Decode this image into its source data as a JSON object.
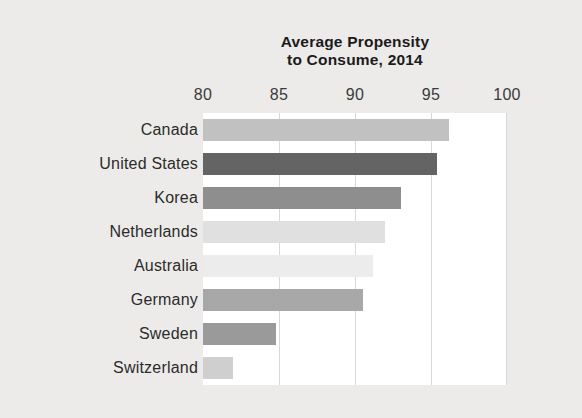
{
  "chart_data": {
    "type": "bar",
    "orientation": "horizontal",
    "title": "Average Propensity to Consume, 2014",
    "title_lines": [
      "Average Propensity",
      "to Consume, 2014"
    ],
    "xlabel": "",
    "ylabel": "",
    "xlim": [
      80,
      100
    ],
    "xticks": [
      80,
      85,
      90,
      95,
      100
    ],
    "xtick_labels": [
      "80",
      "85",
      "90",
      "95",
      "100"
    ],
    "grid": true,
    "grid_axis": "x",
    "legend": false,
    "categories": [
      "Canada",
      "United States",
      "Korea",
      "Netherlands",
      "Australia",
      "Germany",
      "Sweden",
      "Switzerland"
    ],
    "values": [
      96.2,
      95.4,
      93.0,
      92.0,
      91.2,
      90.5,
      84.8,
      82.0
    ],
    "bar_colors": [
      "#c1c1c1",
      "#646464",
      "#8e8e8e",
      "#e0e0e0",
      "#ececec",
      "#a8a8a8",
      "#9a9a9a",
      "#cfcfcf"
    ]
  },
  "figure": {
    "background_color": "#ecebe9",
    "plot_background_color": "#ffffff",
    "gridline_color": "#d8d8d8",
    "title_color": "#1b1b1b",
    "tick_label_color": "#3a3a3a",
    "category_label_color": "#2b2b2b"
  }
}
